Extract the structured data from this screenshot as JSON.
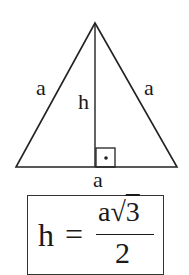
{
  "diagram": {
    "shape": "equilateral-triangle",
    "vertices": {
      "apex": [
        95,
        23
      ],
      "left": [
        16,
        167
      ],
      "right": [
        177,
        167
      ]
    },
    "altitude": {
      "from": [
        95,
        23
      ],
      "to": [
        95,
        167
      ]
    },
    "right_angle_marker": {
      "x": 96,
      "y": 148,
      "size": 19,
      "dot": [
        106,
        158
      ]
    },
    "labels": {
      "left_side": "a",
      "right_side": "a",
      "base": "a",
      "height": "h"
    },
    "stroke_color": "#222222"
  },
  "formula": {
    "lhs": "h",
    "equals": "=",
    "numerator_var": "a",
    "numerator_radical": "√",
    "numerator_radicand": "3",
    "denominator": "2",
    "text": "h = a√3 / 2"
  }
}
